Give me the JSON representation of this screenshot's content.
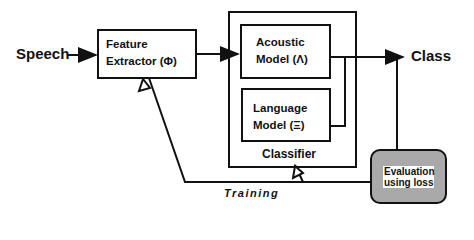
{
  "diagram": {
    "input_label": "Speech",
    "output_label": "Class",
    "feature_extractor": {
      "line1": "Feature",
      "line2": "Extractor (Φ)"
    },
    "acoustic_model": {
      "line1": "Acoustic",
      "line2": "Model (Λ)"
    },
    "language_model": {
      "line1": "Language",
      "line2": "Model (Ξ)"
    },
    "classifier_label": "Classifier",
    "evaluation": {
      "line1": "Evaluation",
      "line2": "using loss"
    },
    "training_label": "Training",
    "colors": {
      "stroke": "#111111",
      "evaluation_fill": "#a9a9a9",
      "evaluation_text_bg": "#ffffff"
    }
  }
}
